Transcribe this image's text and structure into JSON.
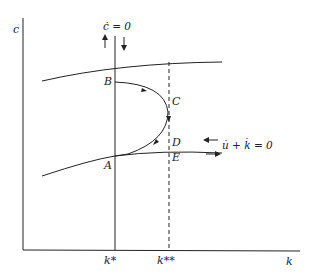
{
  "diagram": {
    "axes": {
      "y_label": "c",
      "x_label": "k"
    },
    "ticks": {
      "k_star": "k*",
      "k_double_star": "k**"
    },
    "loci": {
      "c_dot_zero": "ċ = 0",
      "u_dot_plus_k_dot_zero": "u̇ + k̇ = 0"
    },
    "points": {
      "A": "A",
      "B": "B",
      "C": "C",
      "D": "D",
      "E": "E"
    },
    "colors": {
      "ink": "#222222",
      "background": "#ffffff"
    }
  }
}
